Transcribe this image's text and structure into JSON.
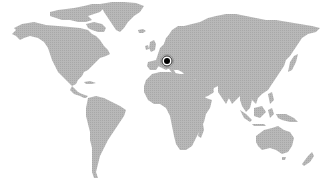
{
  "map": {
    "type": "world-map",
    "style": "dotted-grayscale",
    "colors": {
      "background": "#ffffff",
      "land": "#b4b4b4",
      "land_dot": "#a6a6a6",
      "marker_core": "#000000",
      "marker_ring_dark": "#333333",
      "marker_ring_light": "#888888"
    },
    "continents": [
      "north-america",
      "greenland",
      "south-america",
      "europe",
      "africa",
      "asia",
      "australia",
      "new-zealand",
      "madagascar",
      "indonesia",
      "japan",
      "uk",
      "iceland"
    ],
    "markers": [
      {
        "id": "marker-1",
        "region": "Central Europe",
        "x": 167,
        "y": 61
      }
    ]
  }
}
